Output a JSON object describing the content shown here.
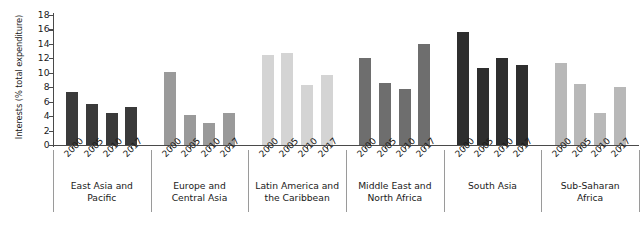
{
  "chart_data": {
    "type": "bar",
    "title": "",
    "xlabel": "",
    "ylabel": "Interests (% total expenditure)",
    "ylim": [
      0,
      18
    ],
    "yticks": [
      0,
      2,
      4,
      6,
      8,
      10,
      12,
      14,
      16,
      18
    ],
    "grid": false,
    "legend": "none",
    "categories": [
      "2000",
      "2005",
      "2010",
      "2017"
    ],
    "groups": [
      {
        "name": "East Asia and\nPacific",
        "color": "#3a3a3a",
        "values": [
          7.3,
          5.7,
          4.4,
          5.3
        ]
      },
      {
        "name": "Europe and\nCentral Asia",
        "color": "#9a9a9a",
        "values": [
          10.1,
          4.1,
          3.1,
          4.5
        ]
      },
      {
        "name": "Latin America and\nthe Caribbean",
        "color": "#d4d4d4",
        "values": [
          12.4,
          12.8,
          8.3,
          9.7
        ]
      },
      {
        "name": "Middle East and\nNorth Africa",
        "color": "#6e6e6e",
        "values": [
          12.0,
          8.6,
          7.7,
          14.0
        ]
      },
      {
        "name": "South Asia",
        "color": "#2e2e2e",
        "values": [
          15.6,
          10.7,
          12.1,
          11.1
        ]
      },
      {
        "name": "Sub-Saharan\nAfrica",
        "color": "#b8b8b8",
        "values": [
          11.3,
          8.4,
          4.5,
          8.0
        ]
      }
    ]
  }
}
